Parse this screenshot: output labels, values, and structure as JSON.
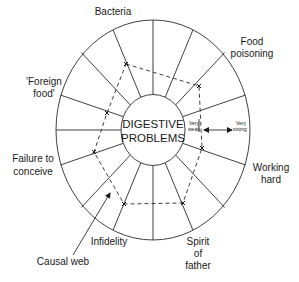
{
  "diagram": {
    "type": "radial-web",
    "center_label_line1": "DIGESTIVE",
    "center_label_line2": "PROBLEMS",
    "scale": {
      "weak_line1": "Very",
      "weak_line2": "weak",
      "strong_line1": "Very",
      "strong_line2": "strong"
    },
    "causes": [
      {
        "label": "Bacteria"
      },
      {
        "label_line1": "Food",
        "label_line2": "poisoning"
      },
      {
        "label_line1": "Working",
        "label_line2": "hard"
      },
      {
        "label_line1": "Spirit",
        "label_line2": "of",
        "label_line3": "father"
      },
      {
        "label": "Infidelity"
      },
      {
        "label_line1": "Failure to",
        "label_line2": "conceive"
      },
      {
        "label_line1": "'Foreign",
        "label_line2": "food'"
      }
    ],
    "pointer_label": "Causal web",
    "spoke_count": 16,
    "polygon_points": "126,64 199,86 202,148 183,203 124,204 94,152 107,113"
  }
}
